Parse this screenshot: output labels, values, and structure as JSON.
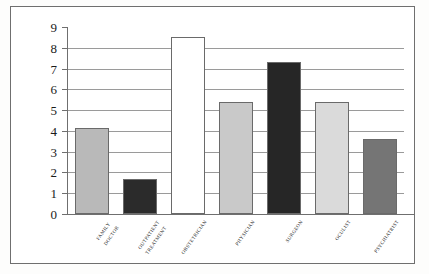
{
  "chart_data": {
    "type": "bar",
    "title": "",
    "subtitle": "",
    "xlabel": "",
    "ylabel": "",
    "ylim": [
      0,
      9
    ],
    "ytick_step": 1,
    "ytick_labels": [
      "9",
      "8",
      "7",
      "6",
      "5",
      "4",
      "3",
      "2",
      "1",
      "0"
    ],
    "grid": true,
    "grid_axis": "y",
    "legend": false,
    "legend_position": "none",
    "categories": [
      "Family doctor",
      "Outpatient treatment",
      "Obstetrician",
      "Physician",
      "Surgeon",
      "Oculist",
      "Psychiatrist"
    ],
    "category_lines": [
      [
        "Family",
        "doctor"
      ],
      [
        "Outpatient",
        "treatment"
      ],
      [
        "Obstetrician"
      ],
      [
        "Physician"
      ],
      [
        "Surgeon"
      ],
      [
        "Oculist"
      ],
      [
        "Psychiatrist"
      ]
    ],
    "values": [
      4.15,
      1.7,
      8.5,
      5.4,
      7.3,
      5.4,
      3.6
    ],
    "bar_colors": [
      "#b9b9b9",
      "#2b2b2b",
      "#ffffff",
      "#c9c9c9",
      "#262626",
      "#dadada",
      "#757575"
    ],
    "bar_edge_color": "#6a6a6a",
    "axis_color": "#6f6f6f",
    "grid_color": "#9a9a9a",
    "background": "#ffffff",
    "frame_color": "#6f6f6f"
  }
}
